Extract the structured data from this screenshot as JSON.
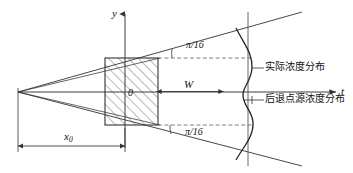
{
  "figure": {
    "type": "technical-diagram",
    "axes": {
      "y_axis_label": "y",
      "t_axis_label": "t",
      "origin_label": "0"
    },
    "dimensions": {
      "width_label": "W",
      "x0_label_base": "x",
      "x0_label_sub": "0"
    },
    "angles": {
      "upper": "π/16",
      "lower": "π/16"
    },
    "callouts": {
      "actual": "实际浓度分布",
      "receding": "后退点源浓度分布"
    },
    "colors": {
      "line": "#333333",
      "hatch": "#555555",
      "dash": "#666666",
      "text": "#111111",
      "curve": "#222222",
      "background": "#ffffff"
    }
  }
}
